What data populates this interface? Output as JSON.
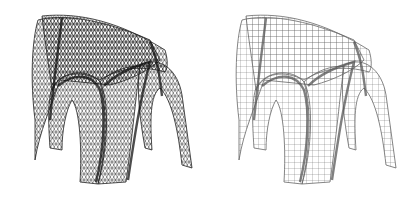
{
  "figure": {
    "panels": [
      {
        "name": "triangular-mesh-vault",
        "mesh": "triangle",
        "stroke": "#222222",
        "dense": "#111111"
      },
      {
        "name": "quad-mesh-vault",
        "mesh": "quad",
        "stroke": "#666666",
        "dense": "#555555"
      }
    ],
    "background": "#ffffff"
  }
}
